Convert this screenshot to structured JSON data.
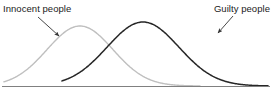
{
  "figure": {
    "labels": {
      "innocent": "Innocent people",
      "guilty": "Guilty people"
    },
    "colors": {
      "innocent_curve": "#bfbfbf",
      "guilty_curve": "#262626",
      "axis": "#808080",
      "text": "#1a1a1a",
      "arrow": "#333333",
      "background": "#ffffff"
    }
  },
  "chart_data": {
    "type": "line",
    "title": "",
    "subtitle": "",
    "xlabel": "",
    "ylabel": "",
    "grid": false,
    "legend_position": "inline-annotations",
    "axis": {
      "baseline_y_px": 86,
      "x_start_px": 2,
      "x_end_px": 270,
      "y_axis_visible": false,
      "x_tick_labels": [],
      "y_tick_labels": []
    },
    "series": [
      {
        "name": "Innocent people",
        "color": "#bfbfbf",
        "line_style": "solid",
        "line_width_px": 1.4,
        "peak_x_px": 80,
        "peak_y_px": 26,
        "start_x_px": 4,
        "end_x_px": 200,
        "mean": 80,
        "sigma": 33,
        "amplitude": 60,
        "x": [
          4,
          14,
          24,
          34,
          44,
          54,
          64,
          74,
          80,
          86,
          96,
          106,
          116,
          126,
          136,
          146,
          156,
          166,
          176,
          186,
          196,
          200
        ],
        "y": [
          86,
          85,
          83,
          78,
          69,
          56,
          42,
          30,
          26,
          28,
          38,
          51,
          64,
          74,
          81,
          84,
          86,
          86,
          86,
          86,
          86,
          86
        ]
      },
      {
        "name": "Guilty people",
        "color": "#262626",
        "line_style": "solid",
        "line_width_px": 1.5,
        "peak_x_px": 143,
        "peak_y_px": 22,
        "start_x_px": 62,
        "end_x_px": 268,
        "mean": 143,
        "sigma": 36,
        "amplitude": 64,
        "x": [
          62,
          72,
          82,
          92,
          102,
          112,
          122,
          132,
          143,
          152,
          162,
          172,
          182,
          192,
          202,
          212,
          222,
          232,
          242,
          252,
          262,
          268
        ],
        "y": [
          86,
          85,
          83,
          78,
          69,
          56,
          42,
          30,
          22,
          25,
          34,
          45,
          57,
          68,
          76,
          82,
          85,
          86,
          86,
          86,
          86,
          86
        ]
      }
    ],
    "annotations": [
      {
        "text": "Innocent people",
        "text_x_px": 3,
        "text_y_px": 3,
        "arrow_from_x_px": 38,
        "arrow_from_y_px": 17,
        "arrow_to_x_px": 59,
        "arrow_to_y_px": 36,
        "target_series": "Innocent people"
      },
      {
        "text": "Guilty people",
        "text_x_px": 196,
        "text_y_px": 3,
        "arrow_from_x_px": 233,
        "arrow_from_y_px": 16,
        "arrow_to_x_px": 218,
        "arrow_to_y_px": 33,
        "target_series": "Guilty people"
      }
    ]
  }
}
